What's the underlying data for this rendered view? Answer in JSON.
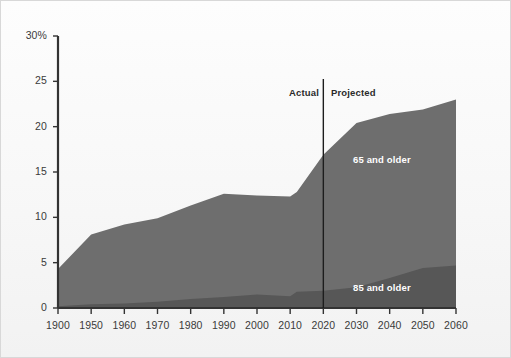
{
  "figure": {
    "background_color": "#fbfbfb",
    "frame_color": "#d8d8d8",
    "axis_color": "#333333"
  },
  "chart_data": {
    "type": "area",
    "stacked": true,
    "title": "",
    "subtitle": "",
    "xlabel": "",
    "ylabel": "",
    "xlim": [
      1900,
      2060
    ],
    "ylim": [
      0,
      30
    ],
    "grid": false,
    "legend_position": "inline-on-area",
    "x_tick_labels": [
      "1900",
      "1950",
      "1960",
      "1970",
      "1980",
      "1990",
      "2000",
      "2010",
      "2020",
      "2030",
      "2040",
      "2050",
      "2060"
    ],
    "x_tick_values": [
      1900,
      1950,
      1960,
      1970,
      1980,
      1990,
      2000,
      2010,
      2020,
      2030,
      2040,
      2050,
      2060
    ],
    "y_tick_labels": [
      "0",
      "5",
      "10",
      "15",
      "20",
      "25",
      "30%"
    ],
    "y_tick_values": [
      0,
      5,
      10,
      15,
      20,
      25,
      30
    ],
    "y_axis_unit": "%",
    "x": [
      1900,
      1950,
      1960,
      1970,
      1980,
      1990,
      2000,
      2010,
      2012,
      2020,
      2030,
      2040,
      2050,
      2060
    ],
    "series": [
      {
        "name": "65 and older",
        "label": "65 and older",
        "color": "#6e6e6e",
        "label_color": "#ffffff",
        "values": [
          4.3,
          8.1,
          9.2,
          9.9,
          11.3,
          12.6,
          12.4,
          12.3,
          12.8,
          16.9,
          20.4,
          21.4,
          21.9,
          23.0
        ]
      },
      {
        "name": "85 and older",
        "label": "85 and older",
        "color": "#575757",
        "label_color": "#ffffff",
        "values": [
          0.2,
          0.4,
          0.5,
          0.7,
          1.0,
          1.2,
          1.5,
          1.3,
          1.8,
          1.9,
          2.3,
          3.3,
          4.4,
          4.7
        ]
      }
    ],
    "annotations": [
      {
        "name": "divider",
        "type": "vline",
        "x": 2020,
        "color": "#1d1d1d"
      },
      {
        "name": "actual-label",
        "text": "Actual",
        "x": 2012,
        "align": "right"
      },
      {
        "name": "projected-label",
        "text": "Projected",
        "x": 2024,
        "align": "left"
      }
    ]
  }
}
